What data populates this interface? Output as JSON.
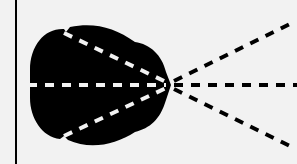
{
  "diagram": {
    "background": "#f2f2f2",
    "ink": "#000000",
    "dash_light": "#f2f2f2",
    "wall": {
      "x": 16,
      "y1": 0,
      "y2": 164
    },
    "blob": {
      "color": "#000000",
      "path": "M 30 70 C 30 45, 45 28, 64 29 L 66 32 L 70 27 C 95 22, 115 28, 135 42 C 150 44, 162 55, 166 72 L 171 85 L 166 100 C 160 120, 150 128, 135 132 C 115 145, 90 150, 68 140 L 64 136 L 60 139 C 42 137, 30 118, 30 98 Z"
    },
    "focus_point": {
      "x": 170,
      "y": 85
    },
    "inner_rays": [
      {
        "x1": 64,
        "y1": 33,
        "x2": 166,
        "y2": 82
      },
      {
        "x1": 28,
        "y1": 85,
        "x2": 166,
        "y2": 85
      },
      {
        "x1": 64,
        "y1": 136,
        "x2": 166,
        "y2": 88
      }
    ],
    "outer_rays": [
      {
        "x1": 174,
        "y1": 81,
        "x2": 290,
        "y2": 24
      },
      {
        "x1": 174,
        "y1": 85,
        "x2": 297,
        "y2": 85
      },
      {
        "x1": 174,
        "y1": 89,
        "x2": 290,
        "y2": 146
      }
    ]
  }
}
